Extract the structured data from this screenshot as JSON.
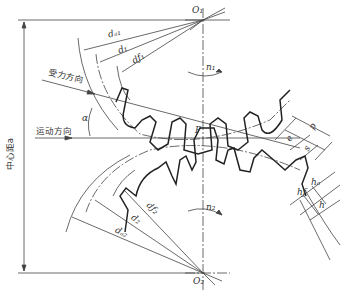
{
  "diagram": {
    "title": "",
    "type": "gear-meshing",
    "labels": {
      "o1": "O₁",
      "o2": "O₂",
      "n1": "n₁",
      "n2": "n₂",
      "pitch_point": "P",
      "alpha": "α",
      "force_direction": "受力方向",
      "motion_direction": "运动方向",
      "center_distance": "中心距a",
      "da1": "dₐ₁",
      "d1": "d₁",
      "df1": "dƒ₁",
      "df2": "dƒ₂",
      "d2": "d₂",
      "da2": "dₐ₂",
      "p": "p",
      "e": "e",
      "s": "s",
      "ha": "hₐ",
      "hf": "hƒ",
      "h": "h"
    },
    "colors": {
      "line": "#333333",
      "thick": "#222222",
      "background": "#ffffff"
    }
  }
}
